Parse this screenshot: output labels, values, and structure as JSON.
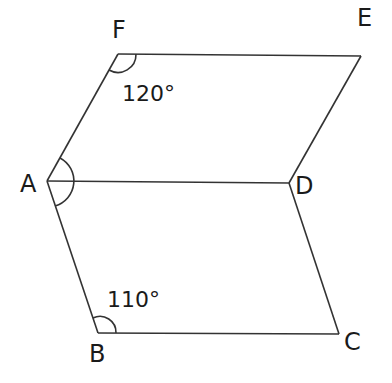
{
  "diagram": {
    "type": "geometry",
    "vertices": [
      {
        "name": "F",
        "x": 118,
        "y": 54,
        "label_x": 112,
        "label_y": 38
      },
      {
        "name": "E",
        "x": 361,
        "y": 56,
        "label_x": 357,
        "label_y": 26
      },
      {
        "name": "A",
        "x": 47,
        "y": 181,
        "label_x": 20,
        "label_y": 192
      },
      {
        "name": "D",
        "x": 289,
        "y": 183,
        "label_x": 295,
        "label_y": 194
      },
      {
        "name": "B",
        "x": 98,
        "y": 333,
        "label_x": 89,
        "label_y": 362
      },
      {
        "name": "C",
        "x": 339,
        "y": 334,
        "label_x": 344,
        "label_y": 350
      }
    ],
    "edges": [
      [
        "F",
        "E"
      ],
      [
        "E",
        "D"
      ],
      [
        "A",
        "F"
      ],
      [
        "A",
        "D"
      ],
      [
        "A",
        "B"
      ],
      [
        "B",
        "C"
      ],
      [
        "C",
        "D"
      ]
    ],
    "angles": [
      {
        "vertex": "F",
        "value": "120°",
        "text_x": 122,
        "text_y": 101
      },
      {
        "vertex": "B",
        "value": "110°",
        "text_x": 107,
        "text_y": 307
      },
      {
        "vertex": "A",
        "value": "",
        "marked": true
      }
    ]
  }
}
